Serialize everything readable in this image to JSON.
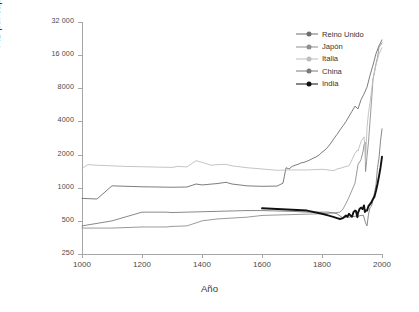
{
  "axes": {
    "y_title": "PIB per cápita (1990 USD PPC)",
    "x_title": "Año",
    "y_ticks": [
      "250",
      "500",
      "1000",
      "2000",
      "4000",
      "8000",
      "16 000",
      "32 000"
    ],
    "x_ticks": [
      "1000",
      "1200",
      "1400",
      "1600",
      "1800",
      "2000"
    ]
  },
  "legend": {
    "items": [
      {
        "label": "Reino Unido",
        "color": "#6e6e6e"
      },
      {
        "label": "Japón",
        "color": "#8f8f8f"
      },
      {
        "label": "Italia",
        "color": "#bdbdbd"
      },
      {
        "label": "China",
        "color": "#7a7a7a"
      },
      {
        "label": "India",
        "color": "#111111"
      }
    ]
  },
  "chart_data": {
    "type": "line",
    "title": "",
    "xlabel": "Año",
    "ylabel": "PIB per cápita (1990 USD PPC)",
    "xlim": [
      1000,
      2000
    ],
    "ylim": [
      250,
      32000
    ],
    "yscale": "log",
    "xscale": "linear",
    "grid": false,
    "legend_position": "top-right",
    "y_tick_values": [
      250,
      500,
      1000,
      2000,
      4000,
      8000,
      16000,
      32000
    ],
    "x_tick_values": [
      1000,
      1200,
      1400,
      1600,
      1800,
      2000
    ],
    "series": [
      {
        "name": "Reino Unido",
        "color": "#6e6e6e",
        "width": 0.9,
        "x": [
          1000,
          1050,
          1100,
          1150,
          1200,
          1250,
          1300,
          1350,
          1380,
          1400,
          1450,
          1480,
          1500,
          1550,
          1570,
          1600,
          1650,
          1670,
          1680,
          1690,
          1700,
          1710,
          1720,
          1730,
          1740,
          1750,
          1760,
          1770,
          1780,
          1790,
          1800,
          1810,
          1820,
          1830,
          1840,
          1850,
          1860,
          1870,
          1880,
          1890,
          1900,
          1910,
          1920,
          1930,
          1940,
          1950,
          1960,
          1970,
          1980,
          1990,
          2000
        ],
        "y": [
          800,
          790,
          1040,
          1030,
          1020,
          1015,
          1010,
          1015,
          1080,
          1060,
          1090,
          1120,
          1080,
          1040,
          1035,
          1030,
          1035,
          1100,
          1520,
          1480,
          1560,
          1600,
          1630,
          1680,
          1700,
          1740,
          1790,
          1850,
          1900,
          1980,
          2100,
          2200,
          2350,
          2550,
          2800,
          3050,
          3350,
          3650,
          4000,
          4450,
          4950,
          5500,
          5200,
          6300,
          7100,
          8200,
          10500,
          13000,
          16500,
          19500,
          22000
        ]
      },
      {
        "name": "Japón",
        "color": "#8f8f8f",
        "width": 0.9,
        "x": [
          1000,
          1100,
          1200,
          1280,
          1300,
          1350,
          1400,
          1450,
          1500,
          1550,
          1600,
          1650,
          1700,
          1750,
          1800,
          1820,
          1840,
          1850,
          1860,
          1870,
          1880,
          1890,
          1900,
          1910,
          1920,
          1930,
          1937,
          1940,
          1944,
          1945,
          1946,
          1950,
          1955,
          1960,
          1965,
          1970,
          1975,
          1980,
          1985,
          1990,
          1995,
          2000
        ],
        "y": [
          430,
          430,
          440,
          440,
          445,
          450,
          500,
          520,
          530,
          540,
          560,
          565,
          570,
          575,
          580,
          585,
          590,
          595,
          600,
          640,
          720,
          820,
          950,
          1100,
          1620,
          1800,
          2150,
          2450,
          2600,
          1400,
          1450,
          1920,
          2600,
          3990,
          6100,
          9700,
          11300,
          13400,
          15300,
          18800,
          19700,
          20700
        ]
      },
      {
        "name": "Italia",
        "color": "#bdbdbd",
        "width": 0.9,
        "x": [
          1000,
          1020,
          1050,
          1100,
          1150,
          1200,
          1250,
          1300,
          1320,
          1350,
          1380,
          1400,
          1430,
          1450,
          1480,
          1500,
          1550,
          1600,
          1650,
          1700,
          1750,
          1800,
          1820,
          1840,
          1850,
          1860,
          1870,
          1880,
          1890,
          1900,
          1910,
          1918,
          1920,
          1930,
          1940,
          1943,
          1945,
          1950,
          1955,
          1960,
          1970,
          1980,
          1990,
          2000
        ],
        "y": [
          1500,
          1620,
          1600,
          1580,
          1560,
          1550,
          1540,
          1530,
          1560,
          1545,
          1760,
          1700,
          1600,
          1620,
          1630,
          1580,
          1520,
          1480,
          1440,
          1450,
          1450,
          1470,
          1450,
          1430,
          1480,
          1500,
          1530,
          1560,
          1580,
          1800,
          2050,
          2200,
          2150,
          2630,
          2900,
          2400,
          1700,
          3500,
          4800,
          5900,
          9700,
          13100,
          16300,
          18700
        ]
      },
      {
        "name": "China",
        "color": "#7a7a7a",
        "width": 0.9,
        "x": [
          1000,
          1100,
          1200,
          1280,
          1300,
          1350,
          1400,
          1450,
          1500,
          1550,
          1600,
          1650,
          1700,
          1750,
          1800,
          1820,
          1840,
          1850,
          1870,
          1880,
          1890,
          1900,
          1913,
          1920,
          1930,
          1938,
          1945,
          1950,
          1955,
          1960,
          1965,
          1970,
          1975,
          1980,
          1985,
          1990,
          1995,
          2000
        ],
        "y": [
          450,
          500,
          600,
          600,
          595,
          600,
          605,
          610,
          615,
          620,
          620,
          615,
          610,
          600,
          600,
          600,
          590,
          580,
          530,
          540,
          540,
          545,
          552,
          550,
          560,
          562,
          480,
          450,
          575,
          660,
          680,
          780,
          900,
          1060,
          1520,
          1860,
          2650,
          3420
        ]
      },
      {
        "name": "India",
        "color": "#111111",
        "width": 1.9,
        "x": [
          1600,
          1650,
          1700,
          1750,
          1800,
          1820,
          1840,
          1850,
          1860,
          1870,
          1880,
          1885,
          1890,
          1895,
          1900,
          1905,
          1910,
          1913,
          1918,
          1920,
          1925,
          1930,
          1935,
          1940,
          1943,
          1946,
          1950,
          1955,
          1960,
          1965,
          1970,
          1975,
          1980,
          1985,
          1990,
          1995,
          2000
        ],
        "y": [
          650,
          640,
          630,
          620,
          580,
          560,
          540,
          530,
          520,
          530,
          560,
          545,
          580,
          560,
          545,
          600,
          620,
          615,
          540,
          590,
          640,
          660,
          640,
          690,
          600,
          620,
          620,
          680,
          710,
          740,
          790,
          830,
          940,
          1080,
          1270,
          1520,
          1910
        ]
      }
    ]
  }
}
